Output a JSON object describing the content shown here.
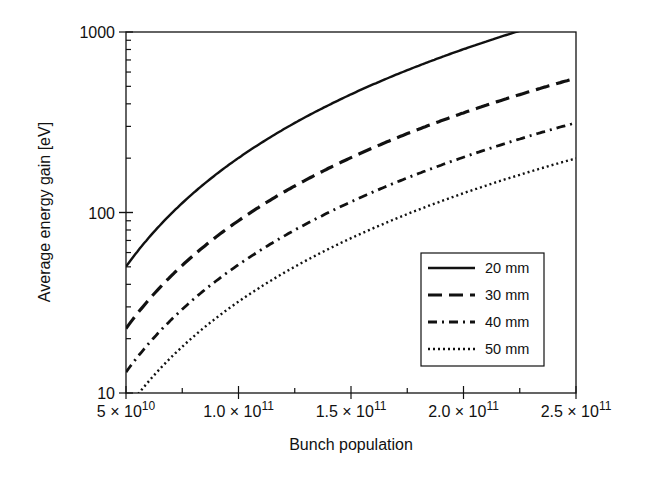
{
  "chart_data": {
    "type": "line",
    "title": "",
    "xlabel": "Bunch population",
    "ylabel": "Average energy gain [eV]",
    "xscale": "linear",
    "yscale": "log",
    "xlim": [
      50000000000.0,
      250000000000.0
    ],
    "ylim": [
      10,
      1000
    ],
    "grid": false,
    "legend_position": "lower right",
    "x_ticks": [
      {
        "value": 50000000000.0,
        "mant": "5",
        "exp": "10"
      },
      {
        "value": 100000000000.0,
        "mant": "1.0",
        "exp": "11"
      },
      {
        "value": 150000000000.0,
        "mant": "1.5",
        "exp": "11"
      },
      {
        "value": 200000000000.0,
        "mant": "2.0",
        "exp": "11"
      },
      {
        "value": 250000000000.0,
        "mant": "2.5",
        "exp": "11"
      }
    ],
    "y_ticks": [
      {
        "value": 10,
        "label": "10"
      },
      {
        "value": 100,
        "label": "100"
      },
      {
        "value": 1000,
        "label": "1000"
      }
    ],
    "x": [
      50000000000.0,
      75000000000.0,
      100000000000.0,
      125000000000.0,
      150000000000.0,
      175000000000.0,
      200000000000.0,
      225000000000.0,
      250000000000.0
    ],
    "series": [
      {
        "name": "20 mm",
        "style": "solid",
        "values": [
          50,
          113,
          200,
          315,
          450,
          620,
          810,
          1000,
          null
        ]
      },
      {
        "name": "30 mm",
        "style": "dashed",
        "values": [
          23,
          50,
          89,
          140,
          205,
          280,
          360,
          450,
          540
        ]
      },
      {
        "name": "40 mm",
        "style": "dashdot",
        "values": [
          13,
          29,
          51,
          80,
          117,
          158,
          205,
          255,
          305
        ]
      },
      {
        "name": "50 mm",
        "style": "dotted",
        "values": [
          null,
          18,
          32,
          50,
          73,
          98,
          128,
          162,
          198
        ]
      }
    ]
  },
  "legend": {
    "items": [
      "20 mm",
      "30 mm",
      "40 mm",
      "50 mm"
    ]
  },
  "times_symbol": "×",
  "base": "10"
}
